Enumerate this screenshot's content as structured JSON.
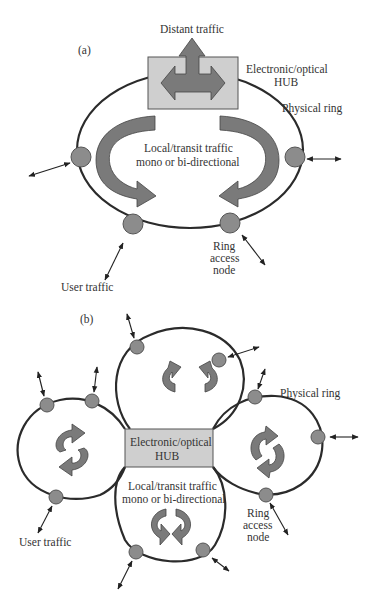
{
  "diagram": {
    "part_a": {
      "label": "(a)",
      "distant_traffic": "Distant traffic",
      "hub_line1": "Electronic/optical",
      "hub_line2": "HUB",
      "physical_ring": "Physical ring",
      "local_line1": "Local/transit traffic",
      "local_line2": "mono or bi-directional",
      "ring_node_line1": "Ring",
      "ring_node_line2": "access",
      "ring_node_line3": "node",
      "user_traffic": "User traffic"
    },
    "part_b": {
      "label": "(b)",
      "hub_line1": "Electronic/optical",
      "hub_line2": "HUB",
      "physical_ring": "Physical ring",
      "local_line1": "Local/transit traffic",
      "local_line2": "mono or bi-directional",
      "ring_node_line1": "Ring",
      "ring_node_line2": "access",
      "ring_node_line3": "node",
      "user_traffic": "User traffic"
    },
    "colors": {
      "ring_stroke": "#2b2b2b",
      "node_fill": "#8c8c8c",
      "hub_fill": "#cfcfcf",
      "arrow_fill": "#7a7a7a"
    }
  }
}
